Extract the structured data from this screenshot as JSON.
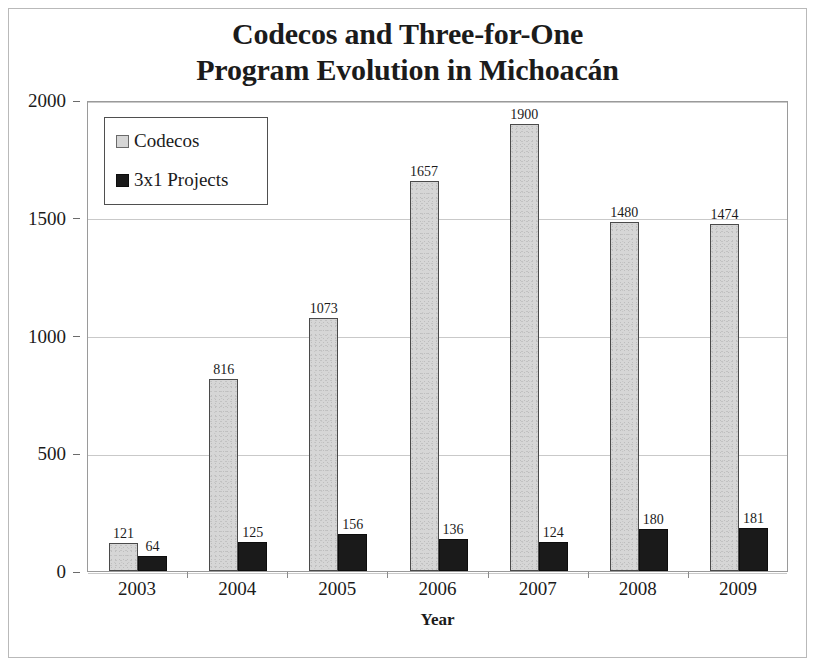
{
  "chart_data": {
    "type": "bar",
    "title": "Codecos and Three-for-One Program Evolution in Michoacán",
    "title_lines": [
      "Codecos and Three-for-One",
      "Program Evolution in Michoacán"
    ],
    "xlabel": "Year",
    "ylabel": "",
    "categories": [
      "2003",
      "2004",
      "2005",
      "2006",
      "2007",
      "2008",
      "2009"
    ],
    "series": [
      {
        "name": "Codecos",
        "color": "#d6d6d6",
        "border_color": "#4a4a4a",
        "values": [
          121,
          816,
          1073,
          1657,
          1900,
          1480,
          1474
        ]
      },
      {
        "name": "3x1 Projects",
        "color": "#1a1a1a",
        "border_color": "#0d0d0d",
        "values": [
          64,
          125,
          156,
          136,
          124,
          180,
          181
        ]
      }
    ],
    "ylim": [
      0,
      2000
    ],
    "y_ticks": [
      0,
      500,
      1000,
      1500,
      2000
    ],
    "y_tick_labels": [
      "0",
      "500",
      "1000",
      "1500",
      "2000"
    ],
    "grid": true,
    "grid_axis": "y",
    "legend_position": "upper left",
    "data_labels": true
  }
}
